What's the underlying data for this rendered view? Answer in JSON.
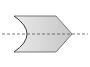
{
  "diagram": {
    "shape": {
      "type": "concave-chevron",
      "fill_start": "#e6e6e6",
      "fill_end": "#c4c4c4",
      "stroke": "#4a4a4a"
    },
    "centerline": {
      "style": "dashed",
      "color": "#555555"
    }
  }
}
